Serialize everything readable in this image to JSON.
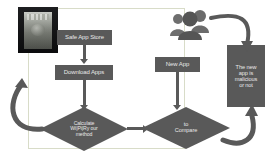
{
  "diagram": {
    "colors": {
      "shape_fill": "#595959",
      "shape_text": "#e8e8e8",
      "connector": "#595959",
      "group_frame": "#d8dcc8",
      "background": "#ffffff"
    },
    "group_frame_label": "trusted-app-group",
    "nodes": [
      {
        "id": "safe-app-store",
        "type": "process",
        "label": "Safe App Store"
      },
      {
        "id": "download-apps",
        "type": "process",
        "label": "Download Apps"
      },
      {
        "id": "calculate-method",
        "type": "decision",
        "label": "Calculate Wi|Pi|Ry our method",
        "lines": [
          "Calculate",
          "Wi|Pi|Ry our",
          "method"
        ]
      },
      {
        "id": "new-app",
        "type": "process",
        "label": "New App"
      },
      {
        "id": "compare",
        "type": "decision",
        "label": "to Compare",
        "lines": [
          "to",
          "Compare"
        ]
      },
      {
        "id": "malicious-or-not",
        "type": "process",
        "label": "The new app is malicious or not",
        "lines": [
          "The new",
          "app is",
          "malicious",
          "or not"
        ]
      }
    ],
    "images": [
      {
        "id": "device-photo",
        "name": "smartphone-photo",
        "description": "Dark smartphone device thumbnail"
      },
      {
        "id": "people-icon",
        "name": "users-group-icon",
        "description": "Group of three user figures"
      }
    ],
    "edges": [
      {
        "id": "e1",
        "from": "safe-app-store",
        "to": "download-apps",
        "kind": "straight-down"
      },
      {
        "id": "e2",
        "from": "download-apps",
        "to": "calculate-method",
        "kind": "straight-down"
      },
      {
        "id": "e3",
        "from": "calculate-method",
        "to": "download-apps",
        "kind": "loop-back-left"
      },
      {
        "id": "e4",
        "from": "calculate-method",
        "to": "compare",
        "kind": "straight-right"
      },
      {
        "id": "e5",
        "from": "new-app",
        "to": "compare",
        "kind": "straight-down"
      },
      {
        "id": "e6",
        "from": "compare",
        "to": "malicious-or-not",
        "kind": "curve-up-right"
      },
      {
        "id": "e7",
        "from": "people-icon",
        "to": "malicious-or-not",
        "kind": "curve-down-right"
      }
    ]
  }
}
